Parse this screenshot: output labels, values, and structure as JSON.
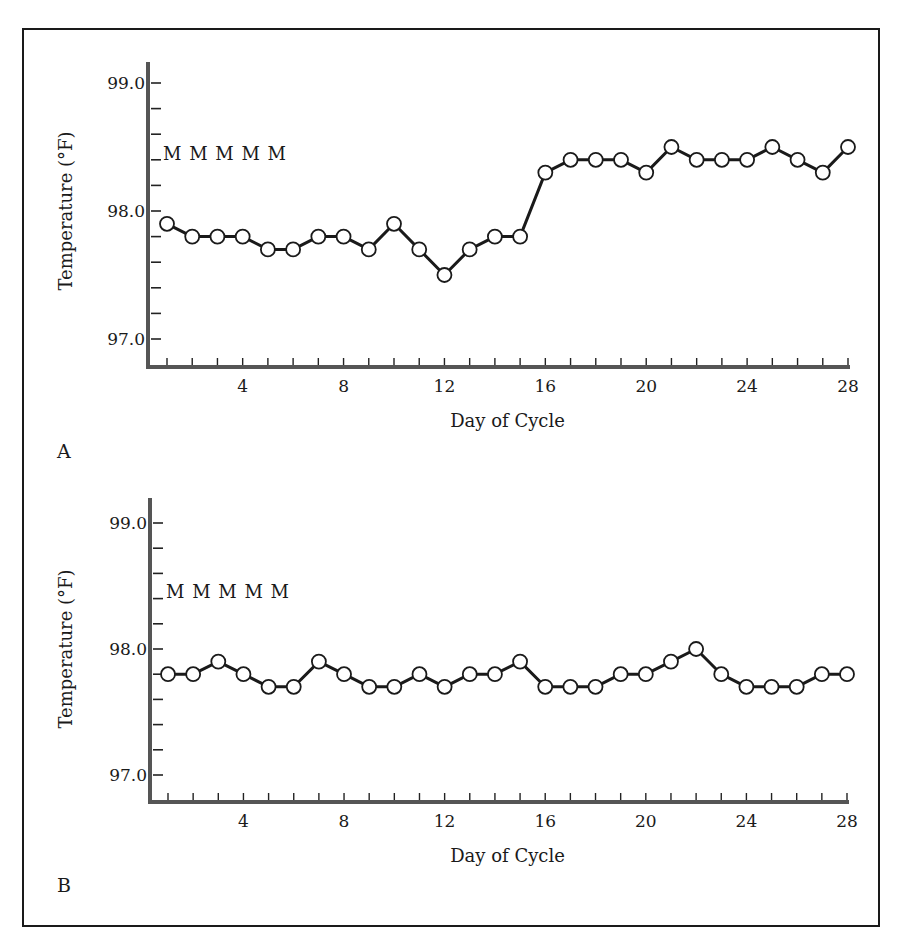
{
  "figure": {
    "panels": [
      {
        "label": "A"
      },
      {
        "label": "B"
      }
    ]
  },
  "chart_data": [
    {
      "type": "line",
      "panel": "A",
      "title": "",
      "xlabel": "Day of Cycle",
      "ylabel": "Temperature (°F)",
      "ylim": [
        97.0,
        99.0
      ],
      "xlim": [
        1,
        28
      ],
      "y_tick_labels": [
        "97.0",
        "98.0",
        "99.0"
      ],
      "y_minor_tick_step": 0.2,
      "x_tick_labels": [
        "4",
        "8",
        "12",
        "16",
        "20",
        "24",
        "28"
      ],
      "annotation": "M M M M M",
      "markers": "open-circle",
      "x": [
        1,
        2,
        3,
        4,
        5,
        6,
        7,
        8,
        9,
        10,
        11,
        12,
        13,
        14,
        15,
        16,
        17,
        18,
        19,
        20,
        21,
        22,
        23,
        24,
        25,
        26,
        27,
        28
      ],
      "values": [
        97.9,
        97.8,
        97.8,
        97.8,
        97.7,
        97.7,
        97.8,
        97.8,
        97.7,
        97.9,
        97.7,
        97.5,
        97.7,
        97.8,
        97.8,
        98.3,
        98.4,
        98.4,
        98.4,
        98.3,
        98.5,
        98.4,
        98.4,
        98.4,
        98.5,
        98.4,
        98.3,
        98.5
      ]
    },
    {
      "type": "line",
      "panel": "B",
      "title": "",
      "xlabel": "Day of Cycle",
      "ylabel": "Temperature (°F)",
      "ylim": [
        97.0,
        99.0
      ],
      "xlim": [
        1,
        28
      ],
      "y_tick_labels": [
        "97.0",
        "98.0",
        "99.0"
      ],
      "y_minor_tick_step": 0.2,
      "x_tick_labels": [
        "4",
        "8",
        "12",
        "16",
        "20",
        "24",
        "28"
      ],
      "annotation": "M M M M M",
      "markers": "open-circle",
      "x": [
        1,
        2,
        3,
        4,
        5,
        6,
        7,
        8,
        9,
        10,
        11,
        12,
        13,
        14,
        15,
        16,
        17,
        18,
        19,
        20,
        21,
        22,
        23,
        24,
        25,
        26,
        27,
        28
      ],
      "values": [
        97.8,
        97.8,
        97.9,
        97.8,
        97.7,
        97.7,
        97.9,
        97.8,
        97.7,
        97.7,
        97.8,
        97.7,
        97.8,
        97.8,
        97.9,
        97.7,
        97.7,
        97.7,
        97.8,
        97.8,
        97.9,
        98.0,
        97.8,
        97.7,
        97.7,
        97.7,
        97.8,
        97.8
      ]
    }
  ]
}
